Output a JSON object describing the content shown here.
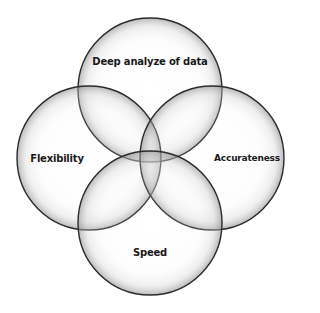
{
  "diagram": {
    "type": "venn",
    "circle_count": 4,
    "stroke_color": "#2b2b2b",
    "fill_light": "#ffffff",
    "fill_shade": "#9a9a9a",
    "circles": [
      {
        "id": "top",
        "label": "Deep analyze of data",
        "cx": 150,
        "cy": 90,
        "r": 72,
        "label_x": 150,
        "label_y": 61
      },
      {
        "id": "left",
        "label": "Flexibility",
        "cx": 89,
        "cy": 158,
        "r": 72,
        "label_x": 57,
        "label_y": 158
      },
      {
        "id": "right",
        "label": "Accurateness",
        "cx": 212,
        "cy": 158,
        "r": 72,
        "label_x": 247,
        "label_y": 158
      },
      {
        "id": "bottom",
        "label": "Speed",
        "cx": 150,
        "cy": 223,
        "r": 72,
        "label_x": 150,
        "label_y": 252
      }
    ]
  }
}
